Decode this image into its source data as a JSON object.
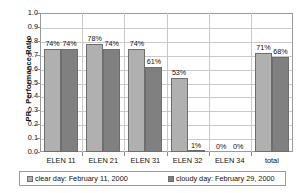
{
  "chart_data": {
    "type": "bar",
    "title": "",
    "xlabel": "",
    "ylabel": "PR - Performance Ratio",
    "ylim": [
      0.0,
      1.0
    ],
    "ytick_step": 0.1,
    "grid": true,
    "legend_position": "bottom",
    "categories": [
      "ELEN 11",
      "ELEN 21",
      "ELEN 31",
      "ELEN 32",
      "ELEN 34",
      "total"
    ],
    "ytick_labels": [
      "1.0",
      "0.9",
      "0.8",
      "0.7",
      "0.6",
      "0.5",
      "0.4",
      "0.3",
      "0.2",
      "0.1",
      "0.0"
    ],
    "ytick_values": [
      1.0,
      0.9,
      0.8,
      0.7,
      0.6,
      0.5,
      0.4,
      0.3,
      0.2,
      0.1,
      0.0
    ],
    "series": [
      {
        "name": "clear day: February 11, 2000",
        "color": "#b0b0b0",
        "values": [
          0.74,
          0.78,
          0.74,
          0.53,
          0.0,
          0.71
        ],
        "labels": [
          "74%",
          "78%",
          "74%",
          "53%",
          "0%",
          "71%"
        ]
      },
      {
        "name": "cloudy day: February 29, 2000",
        "color": "#808080",
        "values": [
          0.74,
          0.74,
          0.61,
          0.01,
          0.0,
          0.68
        ],
        "labels": [
          "74%",
          "74%",
          "61%",
          "1%",
          "0%",
          "68%"
        ]
      }
    ]
  },
  "legend": {
    "items": [
      {
        "label": "clear day: February 11, 2000"
      },
      {
        "label": "cloudy day: February 29, 2000"
      }
    ]
  },
  "axes": {
    "y_title": "PR - Performance Ratio"
  }
}
